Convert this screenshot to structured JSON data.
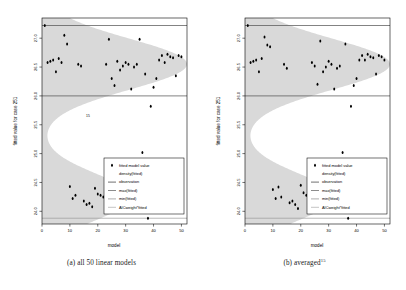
{
  "figure": {
    "panels": [
      {
        "id": "panel-a",
        "caption_text": "(a) all 50 linear models",
        "caption_main": "(a) all 50 linear models",
        "caption_sup": "",
        "inline_note": "15"
      },
      {
        "id": "panel-b",
        "caption_text": "(b) averaged15",
        "caption_main": "(b) averaged",
        "caption_sup": "15",
        "inline_note": ""
      }
    ]
  },
  "chart_data": {
    "type": "scatter",
    "title": "",
    "xlabel": "model",
    "ylabel": "fitted value for case 251",
    "xlim": [
      0,
      52
    ],
    "ylim": [
      23.78,
      27.35
    ],
    "xticks": [
      0,
      10,
      20,
      30,
      40,
      50
    ],
    "xtick_labels": [
      "0",
      "10",
      "20",
      "30",
      "40",
      "50"
    ],
    "yticks": [
      24.0,
      24.5,
      25.0,
      25.5,
      26.0,
      26.5,
      27.0
    ],
    "ytick_labels": [
      "24.0",
      "24.5",
      "25.0",
      "25.5",
      "26.0",
      "26.5",
      "27.0"
    ],
    "grid": false,
    "legend_position": "bottom-right",
    "legend": [
      {
        "label": "fitted model value",
        "marker": "point",
        "color": "#000000"
      },
      {
        "label": "density(fitted)",
        "marker": "shading",
        "color": "#d6d6d6"
      },
      {
        "label": "observation",
        "marker": "line",
        "color": "#4d4d4d"
      },
      {
        "label": "max(fitted)",
        "marker": "line",
        "color": "#6e6e6e"
      },
      {
        "label": "min(fitted)",
        "marker": "line",
        "color": "#9a9a9a"
      },
      {
        "label": "AICweight*fitted",
        "marker": "line",
        "color": "#b5b5b5"
      }
    ],
    "reference_lines": [
      {
        "name": "max(fitted)",
        "y": 27.22,
        "color": "#4d4d4d"
      },
      {
        "name": "observation",
        "y": 26.0,
        "color": "#4d4d4d"
      },
      {
        "name": "min(fitted)",
        "y": 23.88,
        "color": "#8d8d8d"
      }
    ],
    "series": [
      {
        "name": "fitted model value",
        "points_a": [
          [
            1,
            27.22
          ],
          [
            2,
            26.58
          ],
          [
            3,
            26.6
          ],
          [
            4,
            26.62
          ],
          [
            5,
            26.42
          ],
          [
            6,
            26.65
          ],
          [
            7,
            26.58
          ],
          [
            8,
            27.05
          ],
          [
            9,
            26.9
          ],
          [
            10,
            24.43
          ],
          [
            11,
            24.22
          ],
          [
            12,
            24.28
          ],
          [
            13,
            26.55
          ],
          [
            14,
            26.52
          ],
          [
            15,
            24.18
          ],
          [
            16,
            24.12
          ],
          [
            17,
            24.14
          ],
          [
            18,
            24.08
          ],
          [
            19,
            24.4
          ],
          [
            20,
            24.3
          ],
          [
            21,
            24.28
          ],
          [
            22,
            24.25
          ],
          [
            23,
            26.55
          ],
          [
            24,
            26.98
          ],
          [
            25,
            26.3
          ],
          [
            26,
            26.18
          ],
          [
            27,
            26.6
          ],
          [
            28,
            26.45
          ],
          [
            29,
            26.52
          ],
          [
            30,
            26.58
          ],
          [
            31,
            26.55
          ],
          [
            32,
            26.12
          ],
          [
            33,
            26.5
          ],
          [
            34,
            26.55
          ],
          [
            35,
            26.98
          ],
          [
            36,
            25.02
          ],
          [
            37,
            26.38
          ],
          [
            38,
            23.88
          ],
          [
            39,
            25.82
          ],
          [
            40,
            26.15
          ],
          [
            41,
            26.3
          ],
          [
            42,
            26.62
          ],
          [
            43,
            26.7
          ],
          [
            44,
            26.58
          ],
          [
            45,
            26.72
          ],
          [
            46,
            26.68
          ],
          [
            47,
            26.66
          ],
          [
            48,
            26.35
          ],
          [
            49,
            26.7
          ],
          [
            50,
            26.68
          ]
        ],
        "points_b": [
          [
            1,
            27.22
          ],
          [
            2,
            26.58
          ],
          [
            3,
            26.6
          ],
          [
            4,
            26.62
          ],
          [
            5,
            26.42
          ],
          [
            6,
            26.65
          ],
          [
            7,
            27.02
          ],
          [
            8,
            26.88
          ],
          [
            9,
            26.85
          ],
          [
            10,
            24.38
          ],
          [
            11,
            24.22
          ],
          [
            12,
            24.42
          ],
          [
            13,
            24.25
          ],
          [
            14,
            26.55
          ],
          [
            15,
            26.48
          ],
          [
            16,
            24.15
          ],
          [
            17,
            24.18
          ],
          [
            18,
            24.12
          ],
          [
            19,
            24.05
          ],
          [
            20,
            24.45
          ],
          [
            21,
            24.32
          ],
          [
            22,
            24.28
          ],
          [
            23,
            24.25
          ],
          [
            24,
            26.58
          ],
          [
            25,
            26.52
          ],
          [
            26,
            26.2
          ],
          [
            27,
            26.95
          ],
          [
            28,
            26.42
          ],
          [
            29,
            26.5
          ],
          [
            30,
            26.6
          ],
          [
            31,
            26.55
          ],
          [
            32,
            26.12
          ],
          [
            33,
            26.48
          ],
          [
            34,
            26.52
          ],
          [
            35,
            25.02
          ],
          [
            36,
            26.9
          ],
          [
            37,
            23.88
          ],
          [
            38,
            25.82
          ],
          [
            39,
            26.18
          ],
          [
            40,
            26.3
          ],
          [
            41,
            26.62
          ],
          [
            42,
            26.7
          ],
          [
            43,
            26.62
          ],
          [
            44,
            26.72
          ],
          [
            45,
            26.68
          ],
          [
            46,
            26.66
          ],
          [
            47,
            26.38
          ],
          [
            48,
            26.7
          ],
          [
            49,
            26.68
          ],
          [
            50,
            26.62
          ]
        ]
      }
    ],
    "density": {
      "description": "horizontal density of fitted values shaded in light gray, spanning full x-range at each y",
      "mode1_y": 26.55,
      "mode2_y": 24.25,
      "trough_y": 25.4
    }
  }
}
